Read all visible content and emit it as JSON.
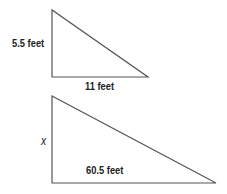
{
  "diagram": {
    "small_triangle": {
      "vertical_leg_label": "5.5 feet",
      "horizontal_leg_label": "11 feet",
      "vertices": [
        [
          52,
          10
        ],
        [
          52,
          77
        ],
        [
          148,
          77
        ]
      ]
    },
    "large_triangle": {
      "vertical_leg_label": "x",
      "horizontal_leg_label": "60.5 feet",
      "vertices": [
        [
          52,
          96
        ],
        [
          52,
          183
        ],
        [
          216,
          183
        ]
      ]
    },
    "stroke_color": "#555555"
  }
}
